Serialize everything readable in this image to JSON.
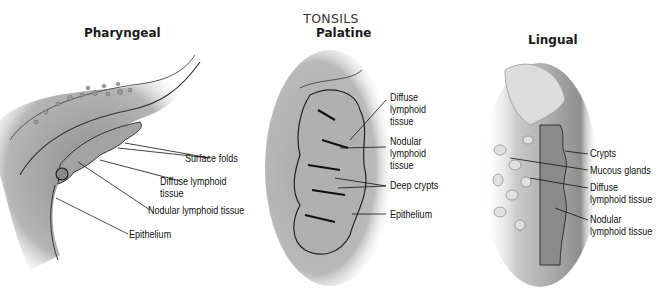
{
  "title": "TONSILS",
  "panels": [
    {
      "name": "Pharyngeal",
      "labels": [
        "Surface folds",
        "Diffuse lymphoid",
        "tissue",
        "Nodular lymphoid tissue",
        "Epithelium"
      ]
    },
    {
      "name": "Palatine",
      "labels": [
        "Diffuse",
        "lymphoid",
        "tissue",
        "Nodular",
        "lymphoid",
        "tissue",
        "Deep crypts",
        "Epithelium"
      ]
    },
    {
      "name": "Lingual",
      "labels": [
        "Crypts",
        "Mucous glands",
        "Diffuse",
        "lymphoid tissue",
        "Nodular",
        "lymphoid tissue"
      ]
    }
  ],
  "colors": {
    "tissue": "#9a9a9a",
    "tissue_light": "#c8c8c8",
    "outline": "#222222",
    "text": "#111111"
  }
}
